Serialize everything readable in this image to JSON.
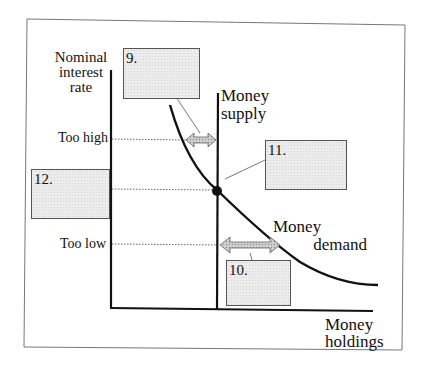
{
  "diagram": {
    "y_axis_title": [
      "Nominal",
      "interest",
      "rate"
    ],
    "x_axis_title": [
      "Money",
      "holdings"
    ],
    "curves": {
      "money_supply": [
        "Money",
        "supply"
      ],
      "money_demand": [
        "Money",
        "demand"
      ]
    },
    "rate_levels": {
      "too_high": "Too high",
      "too_low": "Too low"
    },
    "answer_boxes": [
      {
        "id": "9",
        "label": "9."
      },
      {
        "id": "10",
        "label": "10."
      },
      {
        "id": "11",
        "label": "11."
      },
      {
        "id": "12",
        "label": "12."
      }
    ],
    "colors": {
      "line": "#111111",
      "box_fill": "#ececec",
      "arrow_fill": "#bdbdbd",
      "border": "#777777"
    }
  }
}
